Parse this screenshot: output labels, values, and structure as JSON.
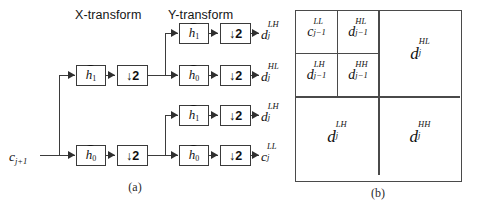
{
  "figure": {
    "panel_a": {
      "caption": "(a)",
      "headers": {
        "x_transform": "X-transform",
        "y_transform": "Y-transform"
      },
      "input": {
        "symbol": "c",
        "sub": "j+1",
        "full": "c j+1"
      },
      "blocks": {
        "filter_highpass": {
          "symbol": "h",
          "sub": "1",
          "overbar": true
        },
        "filter_lowpass": {
          "symbol": "h",
          "sub": "0",
          "overbar": true
        },
        "downsample": "↓2"
      },
      "x_stage": [
        {
          "filter": "h1",
          "filter_label": "h",
          "filter_sub": "1",
          "down_label": "↓2"
        },
        {
          "filter": "h0",
          "filter_label": "h",
          "filter_sub": "0",
          "down_label": "↓2"
        }
      ],
      "y_stage": [
        {
          "filter_label": "h",
          "filter_sub": "1",
          "down_label": "↓2",
          "output_symbol": "d",
          "output_sub": "j",
          "output_sup": "LH"
        },
        {
          "filter_label": "h",
          "filter_sub": "0",
          "down_label": "↓2",
          "output_symbol": "d",
          "output_sub": "j",
          "output_sup": "HL"
        },
        {
          "filter_label": "h",
          "filter_sub": "1",
          "down_label": "↓2",
          "output_symbol": "d",
          "output_sub": "j",
          "output_sup": "LH"
        },
        {
          "filter_label": "h",
          "filter_sub": "0",
          "down_label": "↓2",
          "output_symbol": "c",
          "output_sub": "j",
          "output_sup": "LL"
        }
      ]
    },
    "panel_b": {
      "caption": "(b)",
      "subbands": [
        {
          "symbol": "c",
          "sub": "j−1",
          "sup": "LL",
          "size": "small"
        },
        {
          "symbol": "d",
          "sub": "j−1",
          "sup": "HL",
          "size": "small"
        },
        {
          "symbol": "d",
          "sub": "j−1",
          "sup": "LH",
          "size": "small"
        },
        {
          "symbol": "d",
          "sub": "j−1",
          "sup": "HH",
          "size": "small"
        },
        {
          "symbol": "d",
          "sub": "j",
          "sup": "HL",
          "size": "large"
        },
        {
          "symbol": "d",
          "sub": "j",
          "sup": "LH",
          "size": "large"
        },
        {
          "symbol": "d",
          "sub": "j",
          "sup": "HH",
          "size": "large"
        }
      ]
    }
  },
  "colors": {
    "line": "#3b3b3b",
    "box_border": "#3a3a3a",
    "text": "#111111",
    "background": "#ffffff"
  }
}
